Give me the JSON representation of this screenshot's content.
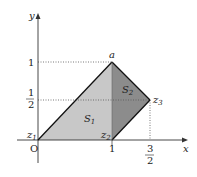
{
  "diagram": {
    "axes": {
      "x_label": "x",
      "y_label": "y",
      "origin_label": "O"
    },
    "ticks": {
      "x": [
        {
          "label": "1"
        },
        {
          "num": "3",
          "den": "2"
        }
      ],
      "y": [
        {
          "label": "1"
        },
        {
          "num": "1",
          "den": "2"
        }
      ]
    },
    "points": {
      "a": {
        "label": "a"
      },
      "z1": {
        "label": "z",
        "sub": "1"
      },
      "z2": {
        "label": "z",
        "sub": "2"
      },
      "z3": {
        "label": "z",
        "sub": "3"
      }
    },
    "regions": {
      "S1": {
        "label": "S",
        "sub": "1",
        "color": "#c8c8c8"
      },
      "S2": {
        "label": "S",
        "sub": "2",
        "color": "#8c8c8c"
      }
    },
    "colors": {
      "axis": "#333333",
      "edge": "#111111",
      "dotted": "#555555"
    }
  }
}
